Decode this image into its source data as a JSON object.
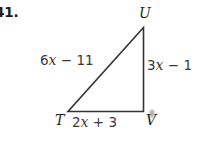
{
  "problem": {
    "number": "41."
  },
  "figure": {
    "type": "triangle",
    "name": "triangle-TUV",
    "vertices": [
      {
        "id": "U",
        "label": "U",
        "x": 143.5,
        "y": 27.5
      },
      {
        "id": "T",
        "label": "T",
        "x": 68.0,
        "y": 111.5
      },
      {
        "id": "V",
        "label": "V",
        "x": 143.5,
        "y": 111.5
      }
    ],
    "sides": [
      {
        "id": "TU",
        "label_prefix": "6",
        "label_var": "x",
        "label_suffix": " − 11",
        "full": "6x − 11",
        "position": "upper-left"
      },
      {
        "id": "UV",
        "label_prefix": "3",
        "label_var": "x",
        "label_suffix": " − 1",
        "full": "3x − 1",
        "position": "right"
      },
      {
        "id": "TV",
        "label_prefix": "2",
        "label_var": "x",
        "label_suffix": " + 3",
        "full": "2x + 3",
        "position": "bottom"
      }
    ],
    "stroke_color": "#333333",
    "stroke_width": 1.6
  },
  "colors": {
    "background": "#ffffff",
    "ink": "#231f20",
    "line": "#333333",
    "label_gray": "#3a3a3a"
  }
}
